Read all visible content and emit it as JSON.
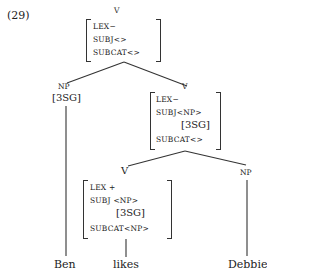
{
  "example_number": "(29)",
  "nodes": {
    "root": {
      "category": "V",
      "features": [
        {
          "attr": "LEX",
          "value": "−"
        },
        {
          "attr": "SUBJ",
          "value": "<>"
        },
        {
          "attr": "SUBCAT",
          "value": "<>"
        }
      ]
    },
    "subject_np": {
      "category": "NP",
      "agreement": "[3SG]",
      "word": "Ben"
    },
    "vp": {
      "category": "V",
      "features": [
        {
          "attr": "LEX",
          "value": "−"
        },
        {
          "attr": "SUBJ",
          "value": "<NP>"
        },
        {
          "attr": "SUBJ_AGR",
          "value": "[3SG]"
        },
        {
          "attr": "SUBCAT",
          "value": "<>"
        }
      ]
    },
    "verb": {
      "category": "V",
      "features": [
        {
          "attr": "LEX",
          "value": "+"
        },
        {
          "attr": "SUBJ",
          "value": "<NP>"
        },
        {
          "attr": "SUBJ_AGR",
          "value": "[3SG]"
        },
        {
          "attr": "SUBCAT",
          "value": "<NP>"
        }
      ],
      "word": "likes"
    },
    "object_np": {
      "category": "NP",
      "word": "Debbie"
    }
  }
}
